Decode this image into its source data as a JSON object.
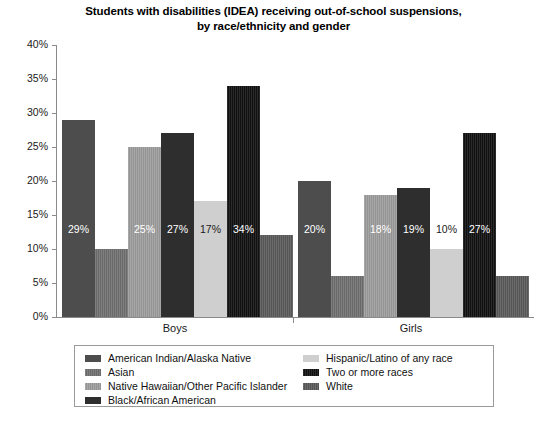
{
  "chart_data": {
    "type": "bar",
    "title": "Students with disabilities (IDEA) receiving out-of-school suspensions, by race/ethnicity and gender",
    "title_line1": "Students with disabilities (IDEA) receiving out-of-school suspensions,",
    "title_line2": "by race/ethnicity and gender",
    "xlabel": "",
    "ylabel": "",
    "ylim": [
      0,
      40
    ],
    "ytick_labels": [
      "0%",
      "5%",
      "10%",
      "15%",
      "20%",
      "25%",
      "30%",
      "35%",
      "40%"
    ],
    "ytick_values": [
      0,
      5,
      10,
      15,
      20,
      25,
      30,
      35,
      40
    ],
    "grid": false,
    "legend_position": "bottom",
    "categories": [
      "Boys",
      "Girls"
    ],
    "series": [
      {
        "name": "American Indian/Alaska Native",
        "color": "#4d4d4d",
        "textured": false,
        "values": [
          29,
          20
        ],
        "labels": [
          "29%",
          "20%"
        ],
        "label_colors": [
          "light",
          "light"
        ]
      },
      {
        "name": "Asian",
        "color": "#707070",
        "textured": true,
        "values": [
          10,
          6
        ],
        "labels": [
          "10%",
          "6%"
        ],
        "label_colors": [
          "light",
          "light"
        ]
      },
      {
        "name": "Native Hawaiian/Other Pacific Islander",
        "color": "#9d9d9d",
        "textured": true,
        "values": [
          25,
          18
        ],
        "labels": [
          "25%",
          "18%"
        ],
        "label_colors": [
          "light",
          "light"
        ]
      },
      {
        "name": "Black/African American",
        "color": "#2e2e2e",
        "textured": false,
        "values": [
          27,
          19
        ],
        "labels": [
          "27%",
          "19%"
        ],
        "label_colors": [
          "light",
          "light"
        ]
      },
      {
        "name": "Hispanic/Latino of any race",
        "color": "#cfcfcf",
        "textured": false,
        "values": [
          17,
          10
        ],
        "labels": [
          "17%",
          "10%"
        ],
        "label_colors": [
          "dark",
          "dark"
        ]
      },
      {
        "name": "Two or more races",
        "color": "#121212",
        "textured": true,
        "values": [
          34,
          27
        ],
        "labels": [
          "34%",
          "27%"
        ],
        "label_colors": [
          "light",
          "light"
        ]
      },
      {
        "name": "White",
        "color": "#5a5a5a",
        "textured": true,
        "values": [
          12,
          6
        ],
        "labels": [
          "12%",
          "6%"
        ],
        "label_colors": [
          "light",
          "light"
        ]
      }
    ]
  },
  "legend": {
    "left_column": [
      "American Indian/Alaska Native",
      "Asian",
      "Native Hawaiian/Other Pacific Islander",
      "Black/African American"
    ],
    "right_column": [
      "Hispanic/Latino of any race",
      "Two or more races",
      "White"
    ]
  }
}
